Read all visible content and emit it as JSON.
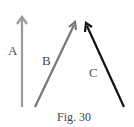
{
  "figure": {
    "caption": "Fig. 30",
    "vectors": [
      {
        "label": "A",
        "color": "#9a9a9a",
        "from": [
          22,
          107
        ],
        "to": [
          22,
          17
        ]
      },
      {
        "label": "B",
        "color": "#777777",
        "from": [
          35,
          107
        ],
        "to": [
          75,
          23
        ]
      },
      {
        "label": "C",
        "color": "#111111",
        "from": [
          124,
          107
        ],
        "to": [
          86,
          24
        ]
      }
    ]
  }
}
